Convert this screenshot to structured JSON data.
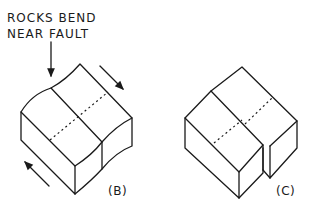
{
  "annotation": {
    "line1": "ROCKS BEND",
    "line2": "NEAR FAULT"
  },
  "panels": [
    {
      "label": "(B)",
      "description": "block with rocks bending near fault, strike-slip motion arrows"
    },
    {
      "label": "(C)",
      "description": "block offset along fault"
    }
  ]
}
